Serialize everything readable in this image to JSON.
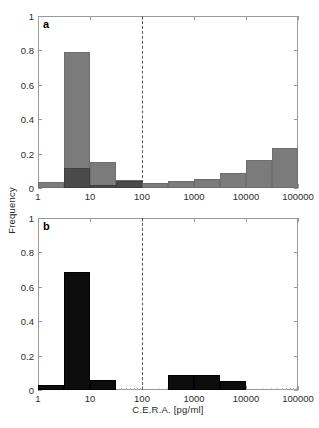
{
  "figure": {
    "width": 319,
    "height": 428,
    "background": "#ffffff"
  },
  "axes": {
    "ylabel": "Frequency",
    "xlabel": "C.E.R.A. [pg/ml]",
    "y_ticks": [
      "0",
      "0.2",
      "0.4",
      "0.6",
      "0.8",
      "1"
    ],
    "x_ticks": [
      "1",
      "10",
      "100",
      "1000",
      "10000",
      "100000"
    ]
  },
  "colors": {
    "bar_gray": "#7b7b7b",
    "bar_dark": "#4a4a4a",
    "bar_black": "#0d0d0d",
    "axis": "#9a9a9a",
    "threshold_line": "#5a5a5a",
    "text": "#2b2b2b"
  },
  "panels": {
    "a": {
      "letter": "a"
    },
    "b": {
      "letter": "b"
    }
  },
  "chart_data": [
    {
      "type": "bar",
      "id": "panel-a",
      "title": "a",
      "xlabel": "C.E.R.A. [pg/ml]",
      "ylabel": "Frequency",
      "xscale": "log",
      "xlim": [
        1,
        100000
      ],
      "ylim": [
        0,
        1
      ],
      "xtick_labels": [
        "1",
        "10",
        "100",
        "1000",
        "10000",
        "100000"
      ],
      "ytick_labels": [
        "0",
        "0.2",
        "0.4",
        "0.6",
        "0.8",
        "1"
      ],
      "grid": false,
      "legend": "none",
      "annotations": [
        {
          "type": "vline",
          "x": 100,
          "style": "dashed",
          "label": ""
        }
      ],
      "series": [
        {
          "name": "overall",
          "color": "#7b7b7b",
          "bins": [
            {
              "x_low": 1,
              "x_high": 3.16,
              "value": 0.035
            },
            {
              "x_low": 3.16,
              "x_high": 10,
              "value": 0.79
            },
            {
              "x_low": 10,
              "x_high": 31.6,
              "value": 0.15
            },
            {
              "x_low": 31.6,
              "x_high": 100,
              "value": 0.045
            },
            {
              "x_low": 100,
              "x_high": 316,
              "value": 0.032
            },
            {
              "x_low": 316,
              "x_high": 1000,
              "value": 0.043
            },
            {
              "x_low": 1000,
              "x_high": 3160,
              "value": 0.055
            },
            {
              "x_low": 3160,
              "x_high": 10000,
              "value": 0.085
            },
            {
              "x_low": 10000,
              "x_high": 31600,
              "value": 0.165
            },
            {
              "x_low": 31600,
              "x_high": 100000,
              "value": 0.235
            },
            {
              "x_low": 100000,
              "x_high": 316000,
              "value": 0.15
            },
            {
              "x_low": 316000,
              "x_high": 1000000,
              "value": 0.04
            }
          ]
        },
        {
          "name": "overlay",
          "color": "#4a4a4a",
          "bins": [
            {
              "x_low": 3.16,
              "x_high": 10,
              "value": 0.118
            },
            {
              "x_low": 10,
              "x_high": 31.6,
              "value": 0.018
            },
            {
              "x_low": 31.6,
              "x_high": 100,
              "value": 0.038
            }
          ]
        }
      ]
    },
    {
      "type": "bar",
      "id": "panel-b",
      "title": "b",
      "xlabel": "C.E.R.A. [pg/ml]",
      "ylabel": "Frequency",
      "xscale": "log",
      "xlim": [
        1,
        100000
      ],
      "ylim": [
        0,
        1
      ],
      "xtick_labels": [
        "1",
        "10",
        "100",
        "1000",
        "10000",
        "100000"
      ],
      "ytick_labels": [
        "0",
        "0.2",
        "0.4",
        "0.6",
        "0.8",
        "1"
      ],
      "grid": false,
      "legend": "none",
      "annotations": [
        {
          "type": "vline",
          "x": 100,
          "style": "dashed",
          "label": ""
        }
      ],
      "series": [
        {
          "name": "overall",
          "color": "#0d0d0d",
          "bins": [
            {
              "x_low": 1,
              "x_high": 3.16,
              "value": 0.03
            },
            {
              "x_low": 3.16,
              "x_high": 10,
              "value": 0.685
            },
            {
              "x_low": 10,
              "x_high": 31.6,
              "value": 0.057
            },
            {
              "x_low": 316,
              "x_high": 1000,
              "value": 0.088
            },
            {
              "x_low": 1000,
              "x_high": 3160,
              "value": 0.088
            },
            {
              "x_low": 3160,
              "x_high": 10000,
              "value": 0.055
            }
          ]
        }
      ]
    }
  ]
}
